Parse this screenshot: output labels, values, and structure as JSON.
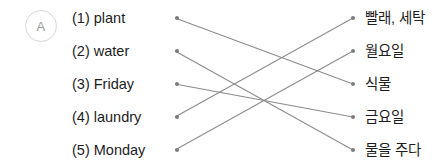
{
  "badge": {
    "letter": "A"
  },
  "left_column": {
    "items": [
      {
        "number": "(1)",
        "label": "(1) plant",
        "word": "plant",
        "y": 18
      },
      {
        "number": "(2)",
        "label": "(2) water",
        "word": "water",
        "y": 51
      },
      {
        "number": "(3)",
        "label": "(3) Friday",
        "word": "Friday",
        "y": 84
      },
      {
        "number": "(4)",
        "label": "(4) laundry",
        "word": "laundry",
        "y": 117
      },
      {
        "number": "(5)",
        "label": "(5) Monday",
        "word": "Monday",
        "y": 150
      }
    ]
  },
  "right_column": {
    "items": [
      {
        "label": "빨래, 세탁",
        "y": 18
      },
      {
        "label": "월요일",
        "y": 51
      },
      {
        "label": "식물",
        "y": 84
      },
      {
        "label": "금요일",
        "y": 117
      },
      {
        "label": "물을 주다",
        "y": 150
      }
    ]
  },
  "connections": [
    {
      "from": "plant",
      "to": "식물",
      "x1": 175,
      "y1": 18,
      "x2": 353,
      "y2": 84
    },
    {
      "from": "water",
      "to": "물을 주다",
      "x1": 175,
      "y1": 51,
      "x2": 353,
      "y2": 150
    },
    {
      "from": "Friday",
      "to": "금요일",
      "x1": 175,
      "y1": 84,
      "x2": 353,
      "y2": 117
    },
    {
      "from": "laundry",
      "to": "빨래, 세탁",
      "x1": 175,
      "y1": 117,
      "x2": 353,
      "y2": 18
    },
    {
      "from": "Monday",
      "to": "월요일",
      "x1": 175,
      "y1": 150,
      "x2": 353,
      "y2": 51
    }
  ],
  "colors": {
    "text": "#1d1d1d",
    "dot": "#7c7c7c",
    "line": "#8c8c8c",
    "badge_border": "#d8d8d8",
    "badge_text": "#9a9a9a",
    "background": "#ffffff"
  }
}
